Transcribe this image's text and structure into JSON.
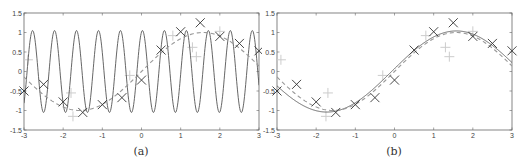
{
  "chart_data": [
    {
      "type": "line",
      "caption": "(a)",
      "title": "",
      "xlabel": "",
      "ylabel": "",
      "xlim": [
        -3,
        3
      ],
      "ylim": [
        -1.5,
        1.5
      ],
      "xticks": [
        -3,
        -2,
        -1,
        0,
        1,
        2,
        3
      ],
      "yticks": [
        -1.5,
        -1,
        -0.5,
        0,
        0.5,
        1,
        1.5
      ],
      "xtick_labels": [
        "-3",
        "-2",
        "-1",
        "0",
        "1",
        "2",
        "3"
      ],
      "ytick_labels": [
        "-1.5",
        "-1",
        "-0.5",
        "0",
        "0.5",
        "1",
        "1.5"
      ],
      "grid": false,
      "legend": null,
      "series": [
        {
          "name": "high-frequency fit",
          "style": "solid",
          "color": "#555555",
          "function": "1.05*sin(11.2*x+1.3)",
          "description": "rapidly oscillating sinusoid, amplitude ~1.05, ~11 periods over [-3,3]"
        },
        {
          "name": "true function",
          "style": "dashed",
          "color": "#999999",
          "function": "sin(x)",
          "description": "dashed gray sine curve"
        },
        {
          "name": "training points",
          "marker": "x",
          "color": "#333333",
          "x": [
            -3,
            -2.5,
            -2,
            -1.5,
            -1,
            -0.5,
            0,
            0.5,
            1,
            1.5,
            2,
            2.5,
            3
          ],
          "y": [
            -0.5,
            -0.33,
            -0.78,
            -1.05,
            -0.85,
            -0.67,
            -0.22,
            0.55,
            1.02,
            1.25,
            0.9,
            0.72,
            0.53
          ]
        },
        {
          "name": "test points",
          "marker": "+",
          "color": "#cccccc",
          "x": [
            -2.9,
            -1.8,
            -1.75,
            -0.3,
            0.8,
            1.3,
            1.4,
            2.0
          ],
          "y": [
            0.3,
            -0.55,
            -1.15,
            -0.1,
            0.92,
            0.62,
            0.38,
            1.03
          ]
        }
      ]
    },
    {
      "type": "line",
      "caption": "(b)",
      "title": "",
      "xlabel": "",
      "ylabel": "",
      "xlim": [
        -3,
        3
      ],
      "ylim": [
        -1.5,
        1.5
      ],
      "xticks": [
        -3,
        -2,
        -1,
        0,
        1,
        2,
        3
      ],
      "yticks": [
        -1.5,
        -1,
        -0.5,
        0,
        0.5,
        1,
        1.5
      ],
      "xtick_labels": [
        "-3",
        "-2",
        "-1",
        "0",
        "1",
        "2",
        "3"
      ],
      "ytick_labels": [
        "-1.5",
        "-1",
        "-0.5",
        "0",
        "0.5",
        "1",
        "1.5"
      ],
      "grid": false,
      "legend": null,
      "series": [
        {
          "name": "smooth fit",
          "style": "solid",
          "color": "#555555",
          "function": "1.04*sin(0.95*x+0.07)",
          "description": "smooth sinusoid closely tracking the true function"
        },
        {
          "name": "true function",
          "style": "dashed",
          "color": "#999999",
          "function": "sin(x)",
          "description": "dashed gray sine curve"
        },
        {
          "name": "training points",
          "marker": "x",
          "color": "#333333",
          "x": [
            -3,
            -2.5,
            -2,
            -1.5,
            -1,
            -0.5,
            0,
            0.5,
            1,
            1.5,
            2,
            2.5,
            3
          ],
          "y": [
            -0.5,
            -0.33,
            -0.78,
            -1.05,
            -0.85,
            -0.67,
            -0.22,
            0.55,
            1.02,
            1.25,
            0.9,
            0.72,
            0.53
          ]
        },
        {
          "name": "test points",
          "marker": "+",
          "color": "#cccccc",
          "x": [
            -2.9,
            -1.7,
            -1.75,
            -0.3,
            0.8,
            1.3,
            1.4,
            2.0
          ],
          "y": [
            0.3,
            -0.55,
            -1.15,
            -0.1,
            0.92,
            0.62,
            0.38,
            1.03
          ]
        }
      ]
    }
  ]
}
